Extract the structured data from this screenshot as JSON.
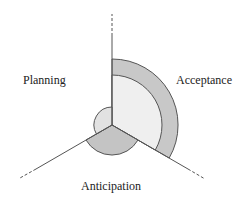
{
  "diagram": {
    "type": "radial-three-axis",
    "center": [
      112,
      125
    ],
    "axes": [
      {
        "name": "Acceptance-Planning divider (top)",
        "angle_deg": 90
      },
      {
        "name": "Planning-Anticipation divider (lower-left)",
        "angle_deg": 210
      },
      {
        "name": "Anticipation-Acceptance divider (lower-right)",
        "angle_deg": 330
      }
    ],
    "sectors": [
      {
        "label": "Acceptance",
        "inner_value": 50,
        "outer_value": 66,
        "inner_color": "#efefef",
        "outer_color": "#c8c8c8"
      },
      {
        "label": "Anticipation",
        "value": 30,
        "color": "#c4c4c4"
      },
      {
        "label": "Planning",
        "value": 18,
        "color": "#e2e2e2"
      }
    ]
  },
  "labels": {
    "planning": "Planning",
    "acceptance": "Acceptance",
    "anticipation": "Anticipation"
  },
  "colors": {
    "line": "#555555",
    "text": "#222222"
  }
}
